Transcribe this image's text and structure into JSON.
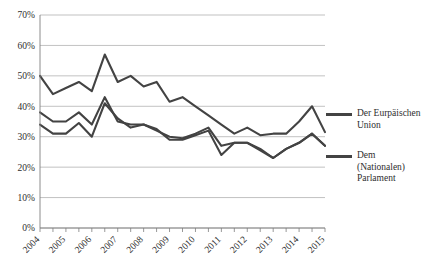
{
  "chart_data": {
    "type": "line",
    "title": "",
    "xlabel": "",
    "ylabel": "",
    "ylim": [
      0,
      70
    ],
    "ytick_labels": [
      "70%",
      "60%",
      "50%",
      "40%",
      "30%",
      "20%",
      "10%",
      "0%"
    ],
    "ytick_values": [
      70,
      60,
      50,
      40,
      30,
      20,
      10,
      0
    ],
    "xtick_labels": [
      "2004",
      "2005",
      "2006",
      "2007",
      "2008",
      "2009",
      "2010",
      "2011",
      "2012",
      "2013",
      "2014",
      "2015"
    ],
    "x": [
      2004.0,
      2004.5,
      2005.0,
      2005.5,
      2006.0,
      2006.5,
      2007.0,
      2007.5,
      2008.0,
      2008.5,
      2009.0,
      2009.5,
      2010.0,
      2010.5,
      2011.0,
      2011.5,
      2012.0,
      2012.5,
      2013.0,
      2013.5,
      2014.0,
      2014.5,
      2015.0
    ],
    "grid": true,
    "legend_position": "right",
    "series": [
      {
        "name": "Der Eurpäischen Union",
        "label_lines": "Der Eurpäischen\nUnion",
        "color": "#434343",
        "values": [
          50,
          44,
          46,
          48,
          45,
          57,
          48,
          50,
          46.5,
          48,
          41.5,
          43,
          40,
          37,
          34,
          31,
          33,
          30.5,
          31,
          31,
          35,
          40,
          31.5
        ]
      },
      {
        "name": "Dem (Nationalen) Parlament A",
        "label_lines": "Dem\n(Nationalen)\nParlament",
        "color": "#434343",
        "values": [
          38,
          35,
          35,
          38,
          34,
          43,
          35,
          34,
          34,
          32,
          30,
          29.5,
          31,
          33,
          27,
          28,
          28,
          26,
          23,
          26,
          28,
          31,
          27
        ]
      },
      {
        "name": "Dem (Nationalen) Parlament B",
        "label_lines": "",
        "color": "#434343",
        "values": [
          34,
          31,
          31,
          34.5,
          30,
          41,
          36,
          33,
          34,
          32.5,
          29,
          29,
          30.5,
          32,
          24,
          28,
          28,
          25.5,
          23,
          26,
          28,
          31,
          27
        ]
      }
    ],
    "legend_entries": [
      {
        "label": "Der Eurpäischen\nUnion",
        "color": "#434343"
      },
      {
        "label": "Dem\n(Nationalen)\nParlament",
        "color": "#434343"
      }
    ]
  }
}
